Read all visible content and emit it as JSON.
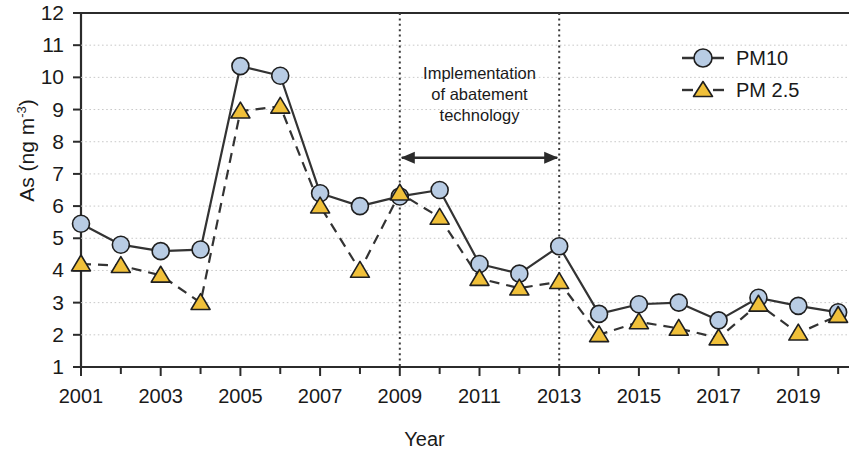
{
  "chart_data": {
    "type": "line",
    "title": "",
    "xlabel": "Year",
    "ylabel": "As (ng m-3)",
    "ylabel_base": "As (ng m",
    "ylabel_sup": "-3",
    "ylabel_close": ")",
    "xlim": [
      2001,
      2020
    ],
    "ylim": [
      1,
      12
    ],
    "ytick_labels": [
      "12",
      "11",
      "10",
      "9",
      "8",
      "7",
      "6",
      "5",
      "4",
      "3",
      "2",
      "1"
    ],
    "yticks": [
      12,
      11,
      10,
      9,
      8,
      7,
      6,
      5,
      4,
      3,
      2,
      1
    ],
    "xtick_labels": [
      "2001",
      "2003",
      "2005",
      "2007",
      "2009",
      "2011",
      "2013",
      "2015",
      "2017",
      "2019"
    ],
    "xticks_major": [
      2001,
      2003,
      2005,
      2007,
      2009,
      2011,
      2013,
      2015,
      2017,
      2019
    ],
    "xticks_minor": [
      2002,
      2004,
      2006,
      2008,
      2010,
      2012,
      2014,
      2016,
      2018,
      2020
    ],
    "grid": true,
    "grid_style": "dotted-horizontal",
    "legend_position": "top-right",
    "x": [
      2001,
      2002,
      2003,
      2004,
      2005,
      2006,
      2007,
      2008,
      2009,
      2010,
      2011,
      2012,
      2013,
      2014,
      2015,
      2016,
      2017,
      2018,
      2019,
      2020
    ],
    "series": [
      {
        "name": "PM10",
        "marker": "circle",
        "marker_color": "#b8cce4",
        "marker_edge": "#1f1f1f",
        "line_style": "solid",
        "line_color": "#333333",
        "values": [
          5.45,
          4.8,
          4.6,
          4.65,
          10.35,
          10.05,
          6.4,
          6.0,
          6.3,
          6.5,
          4.2,
          3.9,
          4.75,
          2.65,
          2.95,
          3.0,
          2.45,
          3.15,
          2.9,
          2.7
        ]
      },
      {
        "name": "PM 2.5",
        "marker": "triangle",
        "marker_color": "#f0c03a",
        "marker_edge": "#1f1f1f",
        "line_style": "dashed",
        "line_color": "#333333",
        "values": [
          4.2,
          4.15,
          3.85,
          3.0,
          8.95,
          9.1,
          6.0,
          4.0,
          6.4,
          5.65,
          3.75,
          3.45,
          3.65,
          2.0,
          2.4,
          2.2,
          1.9,
          2.95,
          2.05,
          2.6
        ]
      }
    ],
    "annotations": [
      {
        "name": "implementation-annotation",
        "line1": "Implementation",
        "line2": "of abatement",
        "line3": "technology"
      }
    ],
    "vertical_markers": [
      {
        "name": "vline-2009",
        "x": 2009,
        "style": "dotted"
      },
      {
        "name": "vline-2013",
        "x": 2013,
        "style": "dotted"
      }
    ],
    "arrow": {
      "from": 2009,
      "to": 2013,
      "y": 7.5,
      "style": "double-headed"
    }
  }
}
